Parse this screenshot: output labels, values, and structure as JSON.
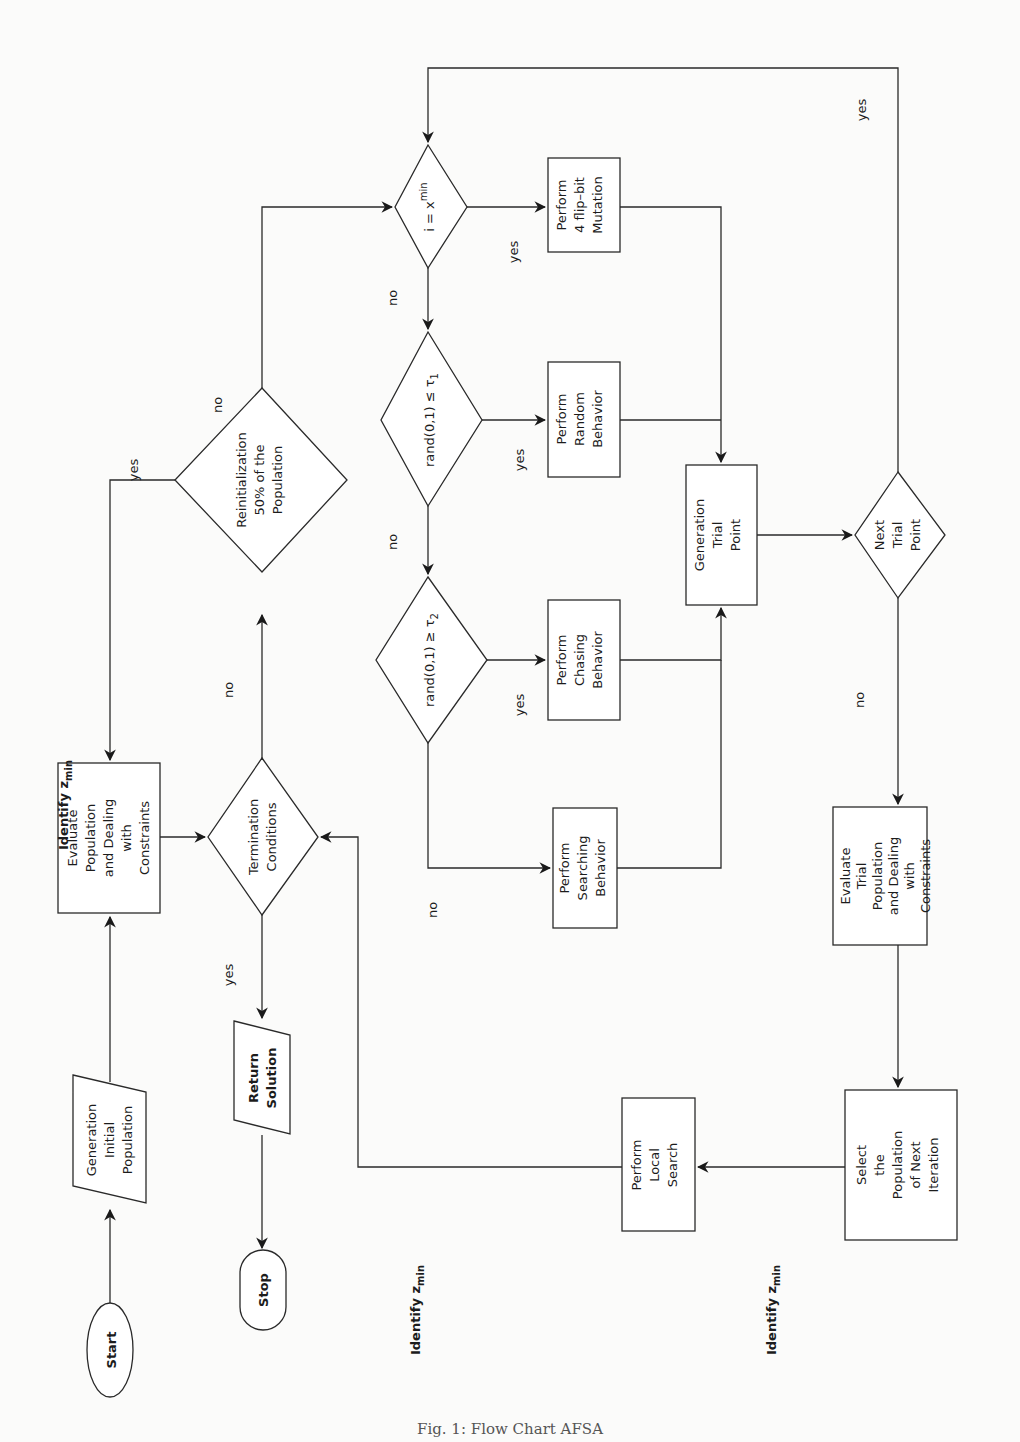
{
  "figure": {
    "caption": "Fig. 1: Flow Chart AFSA",
    "orientation": "rotated 90° counter-clockwise"
  },
  "nodes": {
    "start": {
      "label": "Start",
      "shape": "terminal"
    },
    "generation_initial_population": {
      "lines": [
        "Generation",
        "Initial",
        "Population"
      ],
      "shape": "parallelogram"
    },
    "evaluate_population": {
      "lines": [
        "Evaluate",
        "Population",
        "and Dealing",
        "with",
        "Constraints"
      ],
      "shape": "process"
    },
    "termination_conditions": {
      "lines": [
        "Termination",
        "Conditions"
      ],
      "shape": "decision"
    },
    "return_solution": {
      "lines": [
        "Return",
        "Solution"
      ],
      "shape": "parallelogram"
    },
    "stop": {
      "label": "Stop",
      "shape": "terminal"
    },
    "reinitialization": {
      "lines": [
        "Reinitialization",
        "50% of the",
        "Population"
      ],
      "shape": "decision"
    },
    "i_equals_xmin": {
      "text": "i = x",
      "sup": "min",
      "shape": "decision"
    },
    "perform_flip_bit": {
      "lines": [
        "Perform",
        "4 flip–bit",
        "Mutation"
      ],
      "shape": "process"
    },
    "rand_le_tau1": {
      "text": "rand(0,1) ≤ τ",
      "sub": "1",
      "shape": "decision"
    },
    "perform_random": {
      "lines": [
        "Perform",
        "Random",
        "Behavior"
      ],
      "shape": "process"
    },
    "rand_ge_tau2": {
      "text": "rand(0,1) ≥ τ",
      "sub": "2",
      "shape": "decision"
    },
    "perform_chasing": {
      "lines": [
        "Perform",
        "Chasing",
        "Behavior"
      ],
      "shape": "process"
    },
    "perform_searching": {
      "lines": [
        "Perform",
        "Searching",
        "Behavior"
      ],
      "shape": "process"
    },
    "generation_trial_point": {
      "lines": [
        "Generation",
        "Trial",
        "Point"
      ],
      "shape": "process"
    },
    "next_trial_point": {
      "lines": [
        "Next",
        "Trial",
        "Point"
      ],
      "shape": "decision"
    },
    "evaluate_trial": {
      "lines": [
        "Evaluate",
        "Trial",
        "Population",
        "and Dealing",
        "with",
        "Constraints"
      ],
      "shape": "process"
    },
    "select_population": {
      "lines": [
        "Select",
        "the",
        "Population",
        "of Next",
        "Iteration"
      ],
      "shape": "process"
    },
    "perform_local_search": {
      "lines": [
        "Perform",
        "Local",
        "Search"
      ],
      "shape": "process"
    }
  },
  "edge_labels": {
    "identify_zmin_1": {
      "text": "Identify z",
      "sub": "min"
    },
    "identify_zmin_2": {
      "text": "Identify z",
      "sub": "min"
    },
    "identify_zmin_3": {
      "text": "Identify z",
      "sub": "min"
    },
    "termination_yes": "yes",
    "termination_no": "no",
    "reinit_yes": "yes",
    "reinit_no": "no",
    "ixmin_yes": "yes",
    "ixmin_no": "no",
    "tau1_yes": "yes",
    "tau1_no": "no",
    "tau2_yes": "yes",
    "tau2_no": "no",
    "next_trial_yes": "yes",
    "next_trial_no": "no"
  },
  "colors": {
    "stroke": "#2a2a2a",
    "fill": "#ffffff",
    "background": "#fbfbfa"
  }
}
